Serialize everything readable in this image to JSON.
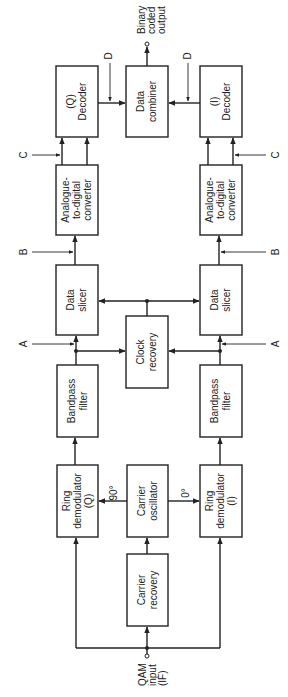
{
  "diagram": {
    "blocks": {
      "q_decoder": [
        "(Q)",
        "Decoder"
      ],
      "data_combiner": [
        "Data",
        "combiner"
      ],
      "i_decoder": [
        "(I)",
        "Decoder"
      ],
      "q_adc": [
        "Analogue-",
        "to-digital",
        "converter"
      ],
      "i_adc": [
        "Analogue-",
        "to-digital",
        "converter"
      ],
      "q_slicer": [
        "Data",
        "slicer"
      ],
      "i_slicer": [
        "Data",
        "slicer"
      ],
      "clock_recovery": [
        "Clock",
        "recovery"
      ],
      "q_bandpass": [
        "Bandpass",
        "filter"
      ],
      "i_bandpass": [
        "Bandpass",
        "filter"
      ],
      "q_ring": [
        "Ring",
        "demodulator",
        "(Q)"
      ],
      "carrier_osc": [
        "Carrier",
        "oscillator"
      ],
      "i_ring": [
        "Ring",
        "demodulator",
        "(I)"
      ],
      "carrier_recovery": [
        "Carrier",
        "recovery"
      ]
    },
    "signals": {
      "input": [
        "QAM",
        "input",
        "(IF)"
      ],
      "output": [
        "Binary",
        "coded",
        "output"
      ],
      "phase_q": "90°",
      "phase_i": "0°",
      "test_points": {
        "a": "A",
        "b": "B",
        "c": "C",
        "d": "D"
      }
    }
  }
}
